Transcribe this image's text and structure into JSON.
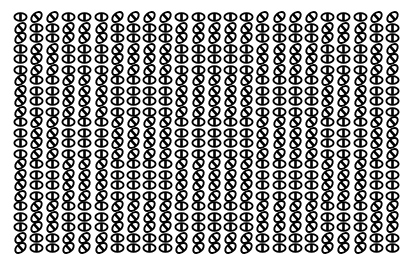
{
  "stimulus": {
    "title": "oriented-ellipse-texture-array",
    "description": "Dense array of ellipse glyphs, each bisected by a bar; bars are either upright or tilted, forming block-structured orientation texture regions.",
    "background_color": "#ffffff",
    "glyph_color": "#000000",
    "grid": {
      "columns": 24,
      "rows": 23,
      "cell_width": 16.2,
      "cell_height": 10.5,
      "margin_left": 12,
      "margin_top": 12
    },
    "glyph_states": {
      "upright": "upright-ellipse-glyph",
      "tilted": "tilted-ellipse-glyph"
    },
    "legend": {
      "upright_label": "upright",
      "tilted_label": "tilted"
    },
    "rows": [
      [
        0,
        1,
        1,
        0,
        0,
        0,
        1,
        1,
        1,
        1,
        0,
        0,
        0,
        0,
        0,
        1,
        1,
        1,
        1,
        0,
        0,
        0,
        1,
        1
      ],
      [
        1,
        0,
        0,
        1,
        1,
        1,
        0,
        0,
        0,
        0,
        1,
        1,
        1,
        1,
        1,
        0,
        0,
        0,
        0,
        1,
        1,
        1,
        0,
        0
      ],
      [
        1,
        0,
        0,
        1,
        1,
        1,
        0,
        0,
        0,
        0,
        1,
        1,
        1,
        1,
        1,
        0,
        0,
        0,
        0,
        1,
        1,
        1,
        0,
        0
      ],
      [
        0,
        1,
        1,
        0,
        0,
        0,
        1,
        1,
        1,
        1,
        0,
        0,
        0,
        0,
        0,
        1,
        1,
        1,
        1,
        0,
        0,
        0,
        1,
        1
      ],
      [
        0,
        1,
        1,
        0,
        0,
        0,
        1,
        1,
        1,
        1,
        0,
        0,
        0,
        0,
        0,
        1,
        1,
        1,
        1,
        0,
        0,
        0,
        1,
        1
      ],
      [
        0,
        1,
        1,
        0,
        0,
        0,
        1,
        1,
        1,
        1,
        0,
        0,
        0,
        0,
        0,
        1,
        1,
        1,
        1,
        0,
        0,
        0,
        1,
        1
      ],
      [
        1,
        0,
        0,
        1,
        1,
        1,
        0,
        0,
        0,
        0,
        1,
        1,
        1,
        1,
        1,
        0,
        0,
        0,
        0,
        1,
        1,
        1,
        0,
        0
      ],
      [
        1,
        0,
        0,
        1,
        1,
        1,
        0,
        0,
        0,
        0,
        1,
        1,
        1,
        1,
        1,
        0,
        0,
        0,
        0,
        1,
        1,
        1,
        0,
        0
      ],
      [
        1,
        0,
        0,
        1,
        1,
        1,
        0,
        0,
        0,
        0,
        1,
        1,
        1,
        1,
        1,
        0,
        0,
        0,
        0,
        1,
        1,
        1,
        0,
        0
      ],
      [
        1,
        0,
        0,
        1,
        1,
        1,
        0,
        0,
        0,
        0,
        1,
        1,
        1,
        1,
        1,
        0,
        0,
        0,
        0,
        1,
        1,
        1,
        0,
        0
      ],
      [
        0,
        1,
        1,
        0,
        0,
        0,
        1,
        1,
        1,
        1,
        0,
        0,
        0,
        0,
        0,
        1,
        1,
        1,
        1,
        0,
        0,
        0,
        1,
        1
      ],
      [
        0,
        1,
        1,
        0,
        0,
        0,
        1,
        1,
        1,
        1,
        0,
        0,
        0,
        0,
        0,
        1,
        1,
        1,
        1,
        0,
        0,
        0,
        1,
        1
      ],
      [
        0,
        1,
        1,
        0,
        0,
        0,
        1,
        1,
        1,
        1,
        0,
        0,
        0,
        0,
        0,
        1,
        1,
        1,
        1,
        0,
        0,
        0,
        1,
        1
      ],
      [
        0,
        1,
        1,
        0,
        0,
        0,
        1,
        1,
        1,
        1,
        0,
        0,
        0,
        0,
        0,
        1,
        1,
        1,
        1,
        0,
        0,
        0,
        1,
        1
      ],
      [
        1,
        0,
        0,
        1,
        1,
        1,
        0,
        0,
        0,
        0,
        1,
        1,
        1,
        1,
        1,
        0,
        0,
        0,
        0,
        1,
        1,
        1,
        0,
        0
      ],
      [
        1,
        0,
        0,
        1,
        1,
        1,
        0,
        0,
        0,
        0,
        1,
        1,
        1,
        1,
        1,
        0,
        0,
        0,
        0,
        1,
        1,
        1,
        0,
        0
      ],
      [
        1,
        0,
        0,
        1,
        1,
        1,
        0,
        0,
        0,
        0,
        1,
        1,
        1,
        1,
        1,
        0,
        0,
        0,
        0,
        1,
        1,
        1,
        0,
        0
      ],
      [
        1,
        0,
        0,
        1,
        1,
        1,
        0,
        0,
        0,
        0,
        1,
        1,
        1,
        1,
        1,
        0,
        0,
        0,
        0,
        1,
        1,
        1,
        0,
        0
      ],
      [
        0,
        1,
        1,
        0,
        0,
        0,
        1,
        1,
        1,
        1,
        0,
        0,
        0,
        0,
        0,
        1,
        1,
        1,
        1,
        0,
        0,
        0,
        1,
        1
      ],
      [
        0,
        1,
        1,
        0,
        0,
        0,
        1,
        1,
        1,
        1,
        0,
        0,
        0,
        0,
        0,
        1,
        1,
        1,
        1,
        0,
        0,
        0,
        1,
        1
      ],
      [
        0,
        1,
        1,
        0,
        0,
        0,
        1,
        1,
        1,
        1,
        0,
        0,
        0,
        0,
        0,
        1,
        1,
        1,
        1,
        0,
        0,
        0,
        1,
        1
      ],
      [
        1,
        0,
        0,
        1,
        1,
        1,
        0,
        0,
        0,
        0,
        1,
        1,
        1,
        1,
        1,
        0,
        0,
        0,
        0,
        1,
        1,
        1,
        0,
        0
      ],
      [
        1,
        0,
        0,
        1,
        1,
        1,
        0,
        0,
        0,
        0,
        1,
        1,
        1,
        1,
        1,
        0,
        0,
        0,
        0,
        1,
        1,
        1,
        0,
        0
      ]
    ]
  }
}
